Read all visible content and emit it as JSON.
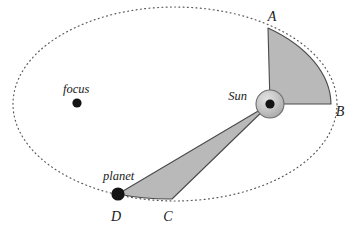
{
  "figure": {
    "type": "astronomy-orbit-diagram",
    "labels": {
      "focus": "focus",
      "sun": "Sun",
      "planet": "planet",
      "point_a": "A",
      "point_b": "B",
      "point_c": "C",
      "point_d": "D"
    },
    "colors": {
      "background": "#ffffff",
      "sector_fill": "#b9b9b9",
      "sector_stroke": "#4a4a4a",
      "orbit_dotted": "#5a5a5a",
      "marker_fill": "#141414",
      "sun_body_fill": "#c3c3c3",
      "sun_core_fill": "#141414",
      "label_text": "#1a1a1a"
    },
    "geometry": {
      "orbit_ellipse": {
        "cx": 175,
        "cy": 104,
        "rx": 162,
        "ry": 97
      },
      "sun": {
        "x": 270,
        "y": 104,
        "outer_r": 14,
        "core_r": 4.5
      },
      "empty_focus": {
        "x": 77,
        "y": 103,
        "r": 4.5
      },
      "planet": {
        "x": 118,
        "y": 194,
        "r": 6.5
      },
      "point_a": {
        "x": 268,
        "y": 28
      },
      "point_b": {
        "x": 331,
        "y": 104
      },
      "point_c": {
        "x": 172,
        "y": 199
      },
      "point_d": {
        "x": 118,
        "y": 194
      }
    },
    "label_positions": {
      "focus": {
        "x": 63,
        "y": 93
      },
      "sun": {
        "x": 220,
        "y": 100
      },
      "planet": {
        "x": 103,
        "y": 180
      },
      "point_a": {
        "x": 268,
        "y": 21
      },
      "point_b": {
        "x": 335,
        "y": 115
      },
      "point_c": {
        "x": 163,
        "y": 221
      },
      "point_d": {
        "x": 110,
        "y": 222
      }
    }
  }
}
